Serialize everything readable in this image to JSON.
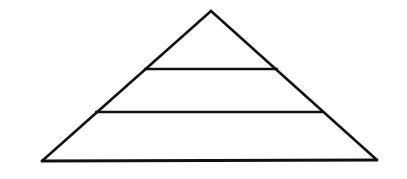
{
  "document": {
    "title": "Pyramid Diagram",
    "type": "blank-pyramid-outline",
    "description": "Outline drawing of a triangle divided into three horizontal tiers by two horizontal lines",
    "background_color": "#ffffff",
    "stroke_color": "#111111"
  },
  "canvas": {
    "width": 407,
    "height": 179
  },
  "chart_data": {
    "type": "pyramid",
    "title": "",
    "xlabel": "",
    "ylabel": "",
    "legend": [],
    "tier_count": 3,
    "tiers": [
      {
        "name": "top-tier",
        "label": "",
        "value": null
      },
      {
        "name": "middle-tier",
        "label": "",
        "value": null
      },
      {
        "name": "bottom-tier",
        "label": "",
        "value": null
      }
    ],
    "geometry": {
      "apex": {
        "x": 211,
        "y": 11
      },
      "bottom_left": {
        "x": 42,
        "y": 161
      },
      "bottom_right": {
        "x": 377,
        "y": 160
      },
      "dividers": [
        {
          "name": "upper-divider",
          "y": 69,
          "x1": 145,
          "x2": 277
        },
        {
          "name": "lower-divider",
          "y": 112,
          "x1": 96,
          "x2": 322
        }
      ]
    },
    "style": {
      "stroke": "#111111",
      "stroke_width": 2.6,
      "fill": "none"
    }
  }
}
